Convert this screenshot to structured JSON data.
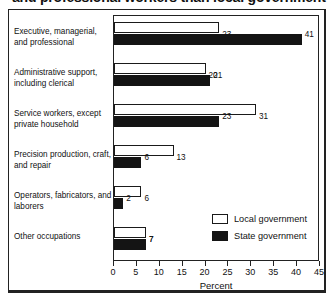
{
  "title": {
    "text": "and professional workers than local government",
    "note_visible": "clipped at top edge of image"
  },
  "chart_data": {
    "type": "bar",
    "orientation": "horizontal",
    "title": "and professional workers than local government",
    "xlabel": "Percent",
    "ylabel": "",
    "xlim": [
      0,
      45
    ],
    "xticks": [
      0,
      5,
      10,
      15,
      20,
      25,
      30,
      35,
      40,
      45
    ],
    "grid": false,
    "legend_position": "inside-lower-right",
    "categories": [
      "Executive,  managerial, and professional",
      "Administrative support, including clerical",
      "Service workers, except private household",
      "Precision production, craft, and repair",
      "Operators, fabricators, and laborers",
      "Other occupations"
    ],
    "series": [
      {
        "name": "Local government",
        "color": "#ffffff",
        "values": [
          23,
          20,
          31,
          13,
          6,
          7
        ]
      },
      {
        "name": "State government",
        "color": "#141414",
        "values": [
          41,
          21,
          23,
          6,
          2,
          7
        ]
      }
    ]
  },
  "axis": {
    "title": "Percent",
    "ticks": [
      "0",
      "5",
      "10",
      "15",
      "20",
      "25",
      "30",
      "35",
      "40",
      "45"
    ]
  },
  "legend": {
    "items": [
      {
        "label": "Local government",
        "swatch": "white-square"
      },
      {
        "label": "State government",
        "swatch": "black-square"
      }
    ]
  },
  "colors": {
    "local_fill": "#ffffff",
    "state_fill": "#141414",
    "outline": "#1a1a1a",
    "frame": "#222222",
    "background": "#ffffff"
  }
}
